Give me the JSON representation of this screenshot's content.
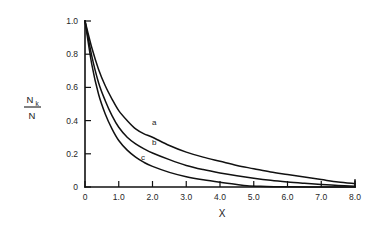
{
  "chart_data": {
    "type": "line",
    "title": "",
    "xlabel": "X",
    "ylabel": "Nk/N",
    "ylabel_numerator": "N",
    "ylabel_numerator_subscript": "k",
    "ylabel_denominator": "N",
    "xlim": [
      0,
      8.0
    ],
    "ylim": [
      0,
      1.0
    ],
    "grid": false,
    "legend": "inline-curve-labels",
    "x_ticks": [
      0,
      1.0,
      2.0,
      3.0,
      4.0,
      5.0,
      6.0,
      7.0,
      8.0
    ],
    "x_tick_labels": [
      "0",
      "1.0",
      "2.0",
      "3.0",
      "4.0",
      "5.0",
      "6.0",
      "7.0",
      "8.0"
    ],
    "y_ticks": [
      0,
      0.2,
      0.4,
      0.6,
      0.8,
      1.0
    ],
    "y_tick_labels": [
      "0",
      "0.2",
      "0.4",
      "0.6",
      "0.8",
      "1.0"
    ],
    "series": [
      {
        "name": "a",
        "label": "a",
        "label_x": 2.05,
        "label_y": 0.375,
        "x": [
          0,
          0.2,
          0.4,
          0.6,
          0.8,
          1.0,
          1.25,
          1.5,
          1.75,
          2.0,
          2.5,
          3.0,
          3.5,
          4.0,
          4.5,
          5.0,
          5.5,
          6.0,
          6.5,
          7.0,
          7.5,
          8.0
        ],
        "values": [
          1.0,
          0.84,
          0.71,
          0.61,
          0.53,
          0.46,
          0.4,
          0.35,
          0.32,
          0.3,
          0.25,
          0.21,
          0.18,
          0.155,
          0.13,
          0.11,
          0.09,
          0.075,
          0.06,
          0.045,
          0.03,
          0.02
        ]
      },
      {
        "name": "b",
        "label": "b",
        "label_x": 2.05,
        "label_y": 0.255,
        "x": [
          0,
          0.2,
          0.4,
          0.6,
          0.8,
          1.0,
          1.25,
          1.5,
          1.75,
          2.0,
          2.5,
          3.0,
          3.5,
          4.0,
          4.5,
          5.0,
          5.5,
          6.0,
          6.5,
          7.0,
          7.5,
          8.0
        ],
        "values": [
          1.0,
          0.79,
          0.63,
          0.52,
          0.43,
          0.36,
          0.3,
          0.26,
          0.23,
          0.205,
          0.165,
          0.13,
          0.105,
          0.085,
          0.068,
          0.053,
          0.04,
          0.03,
          0.022,
          0.015,
          0.009,
          0.005
        ]
      },
      {
        "name": "c",
        "label": "c",
        "label_x": 1.72,
        "label_y": 0.165,
        "x": [
          0,
          0.2,
          0.4,
          0.6,
          0.8,
          1.0,
          1.25,
          1.5,
          1.75,
          2.0,
          2.5,
          3.0,
          3.5,
          4.0,
          4.5,
          4.8,
          5.2,
          5.6,
          6.0,
          7.0,
          8.0
        ],
        "values": [
          1.0,
          0.74,
          0.56,
          0.44,
          0.35,
          0.28,
          0.222,
          0.18,
          0.148,
          0.124,
          0.088,
          0.062,
          0.043,
          0.028,
          0.015,
          0.008,
          0.004,
          0.002,
          0.001,
          0.0,
          0.0
        ]
      }
    ],
    "colors": {
      "curve": "#111111",
      "axis": "#111111",
      "background": "#ffffff",
      "text": "#1a1a1a"
    }
  }
}
